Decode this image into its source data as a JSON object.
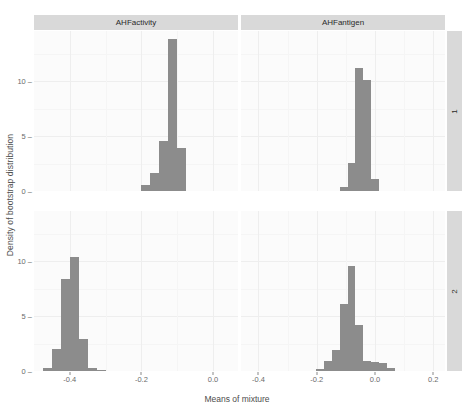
{
  "chart_data": {
    "type": "bar",
    "title": "",
    "xlabel": "Means of mixture",
    "ylabel": "Density of bootstrap distribution",
    "grid": true,
    "legend": "none",
    "facet_layout": "2x2",
    "column_facets": [
      "AHFactivity",
      "AHFantigen"
    ],
    "row_facets": [
      "1",
      "2"
    ],
    "ylim": [
      0,
      14.6
    ],
    "yticks": [
      0,
      5,
      10
    ],
    "yticklabels": [
      "0",
      "5",
      "10"
    ],
    "panels": [
      {
        "name": "AHFactivity-1",
        "column_facet": "AHFactivity",
        "row_facet": "1",
        "xlim": [
          -0.5,
          0.07
        ],
        "xticks": [
          -0.4,
          -0.2,
          0.0
        ],
        "xticklabels": [
          "-0.4",
          "-0.2",
          "0.0"
        ],
        "bin_width": 0.025,
        "bins": [
          {
            "x": -0.1875,
            "value": 0.55
          },
          {
            "x": -0.1625,
            "value": 1.6
          },
          {
            "x": -0.1375,
            "value": 4.55
          },
          {
            "x": -0.1125,
            "value": 13.9
          },
          {
            "x": -0.0875,
            "value": 3.95
          }
        ]
      },
      {
        "name": "AHFantigen-1",
        "column_facet": "AHFantigen",
        "row_facet": "1",
        "xlim": [
          -0.46,
          0.24
        ],
        "xticks": [
          -0.4,
          -0.2,
          0.0,
          0.2
        ],
        "xticklabels": [
          "-0.4",
          "-0.2",
          "0.0",
          "0.2"
        ],
        "bin_width": 0.027,
        "bins": [
          {
            "x": -0.108,
            "value": 0.4
          },
          {
            "x": -0.081,
            "value": 2.6
          },
          {
            "x": -0.054,
            "value": 11.2
          },
          {
            "x": -0.027,
            "value": 10.1
          },
          {
            "x": 0.0,
            "value": 1.1
          }
        ]
      },
      {
        "name": "AHFactivity-2",
        "column_facet": "AHFactivity",
        "row_facet": "2",
        "xlim": [
          -0.5,
          0.07
        ],
        "xticks": [
          -0.4,
          -0.2,
          0.0
        ],
        "xticklabels": [
          "-0.4",
          "-0.2",
          "0.0"
        ],
        "bin_width": 0.025,
        "bins": [
          {
            "x": -0.4625,
            "value": 0.25
          },
          {
            "x": -0.4375,
            "value": 2.0
          },
          {
            "x": -0.4125,
            "value": 8.4
          },
          {
            "x": -0.3875,
            "value": 10.4
          },
          {
            "x": -0.3625,
            "value": 2.9
          },
          {
            "x": -0.3375,
            "value": 0.3
          },
          {
            "x": -0.3125,
            "value": 0.05
          }
        ]
      },
      {
        "name": "AHFantigen-2",
        "column_facet": "AHFantigen",
        "row_facet": "2",
        "xlim": [
          -0.46,
          0.24
        ],
        "xticks": [
          -0.4,
          -0.2,
          0.0,
          0.2
        ],
        "xticklabels": [
          "-0.4",
          "-0.2",
          "0.0",
          "0.2"
        ],
        "bin_width": 0.027,
        "bins": [
          {
            "x": -0.189,
            "value": 0.15
          },
          {
            "x": -0.162,
            "value": 0.95
          },
          {
            "x": -0.135,
            "value": 1.95
          },
          {
            "x": -0.108,
            "value": 6.1
          },
          {
            "x": -0.081,
            "value": 9.6
          },
          {
            "x": -0.054,
            "value": 4.2
          },
          {
            "x": -0.027,
            "value": 0.95
          },
          {
            "x": 0.0,
            "value": 0.85
          },
          {
            "x": 0.027,
            "value": 0.75
          },
          {
            "x": 0.054,
            "value": 0.3
          }
        ]
      }
    ]
  },
  "colors": {
    "bar": "#8c8c8c",
    "panel_background": "#fbfbfb",
    "strip_background": "#d9d9d9",
    "gridline_major": "#eeeeee",
    "gridline_minor": "#f5f5f5",
    "text": "#4d4d4d",
    "tick_text": "#6b6b6b"
  }
}
